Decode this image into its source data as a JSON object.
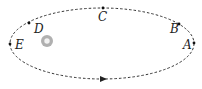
{
  "diagram": {
    "type": "elliptical-orbit",
    "orbit": {
      "cx": 102,
      "cy": 43.5,
      "rx": 92,
      "ry": 35.5,
      "style": "dashed",
      "color": "#333333"
    },
    "star": {
      "cx": 47,
      "cy": 41,
      "r": 6,
      "color": "#b0b0b0"
    },
    "direction_arrow": {
      "x": 103,
      "y": 79,
      "direction": "right"
    },
    "points": [
      {
        "label": "A",
        "x": 194,
        "y": 43,
        "lx": 183,
        "ly": 49
      },
      {
        "label": "B",
        "x": 179,
        "y": 24,
        "lx": 170,
        "ly": 33
      },
      {
        "label": "C",
        "x": 103,
        "y": 8,
        "lx": 98,
        "ly": 21
      },
      {
        "label": "D",
        "x": 29,
        "y": 23,
        "lx": 34,
        "ly": 33
      },
      {
        "label": "E",
        "x": 10,
        "y": 44,
        "lx": 15,
        "ly": 49
      }
    ]
  }
}
